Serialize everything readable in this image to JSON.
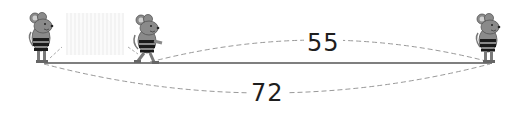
{
  "diagram": {
    "title": "",
    "labels": {
      "upper_distance": "55",
      "lower_distance": "72"
    },
    "figures": [
      {
        "name": "mouse-1",
        "pose": "standing"
      },
      {
        "name": "mouse-2",
        "pose": "walking"
      },
      {
        "name": "mouse-3",
        "pose": "standing"
      }
    ],
    "colors": {
      "line": "#555555",
      "dashed": "#999999",
      "mouse_body": "#8a8a8a",
      "stripe": "#1a1a1a",
      "text": "#1e1e1e"
    }
  }
}
